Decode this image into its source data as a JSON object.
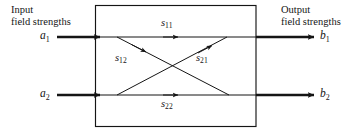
{
  "figure": {
    "type": "two-port-network-scattering-diagram",
    "background_color": "#ffffff",
    "line_color": "#151515",
    "box": {
      "x": 95,
      "y": 5,
      "width": 161,
      "height": 122
    },
    "captions": {
      "input_line1": "Input",
      "input_line2": "field strengths",
      "output_line1": "Output",
      "output_line2": "field strengths"
    },
    "ports": {
      "a1": {
        "base": "a",
        "sub": "1"
      },
      "a2": {
        "base": "a",
        "sub": "2"
      },
      "b1": {
        "base": "b",
        "sub": "1"
      },
      "b2": {
        "base": "b",
        "sub": "2"
      }
    },
    "s_parameters": {
      "s11": {
        "base": "s",
        "sub": "11"
      },
      "s12": {
        "base": "s",
        "sub": "12"
      },
      "s21": {
        "base": "s",
        "sub": "21"
      },
      "s22": {
        "base": "s",
        "sub": "22"
      }
    }
  }
}
